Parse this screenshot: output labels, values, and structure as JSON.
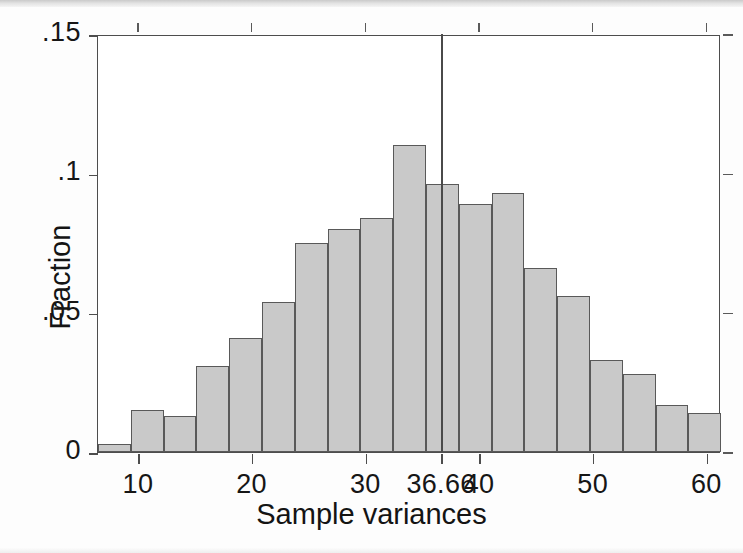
{
  "chart_data": {
    "type": "bar",
    "title": "",
    "subtitle": "",
    "xlabel": "Sample variances",
    "ylabel": "Fraction",
    "xlim": [
      6.4,
      61.2
    ],
    "ylim": [
      0,
      0.15
    ],
    "grid": false,
    "legend": null,
    "x_tick_labels": [
      "10",
      "20",
      "30",
      "36.66",
      "40",
      "50",
      "60"
    ],
    "x_tick_values": [
      10,
      20,
      30,
      36.66,
      40,
      50,
      60
    ],
    "y_tick_labels": [
      "0",
      ".05",
      ".1",
      ".15"
    ],
    "y_tick_values": [
      0,
      0.05,
      0.1,
      0.15
    ],
    "bin_width": 2.885,
    "bin_left_edges": [
      6.4,
      9.28,
      12.17,
      15.05,
      17.94,
      20.82,
      23.71,
      26.59,
      29.48,
      32.36,
      35.25,
      38.13,
      41.02,
      43.9,
      46.79,
      49.67,
      52.56,
      55.44,
      58.33
    ],
    "bin_centers": [
      7.84,
      10.72,
      13.61,
      16.49,
      19.38,
      22.26,
      25.15,
      28.03,
      30.92,
      33.8,
      36.69,
      39.57,
      42.46,
      45.34,
      48.23,
      51.11,
      54.0,
      56.88,
      59.77
    ],
    "values": [
      0.003,
      0.015,
      0.013,
      0.031,
      0.041,
      0.054,
      0.075,
      0.08,
      0.084,
      0.11,
      0.096,
      0.089,
      0.093,
      0.066,
      0.056,
      0.033,
      0.028,
      0.017,
      0.014,
      0.01
    ],
    "bars": [
      {
        "left": 6.4,
        "right": 9.28,
        "value": 0.003
      },
      {
        "left": 9.28,
        "right": 12.17,
        "value": 0.015
      },
      {
        "left": 12.17,
        "right": 15.05,
        "value": 0.013
      },
      {
        "left": 15.05,
        "right": 17.94,
        "value": 0.031
      },
      {
        "left": 17.94,
        "right": 20.82,
        "value": 0.041
      },
      {
        "left": 20.82,
        "right": 23.71,
        "value": 0.054
      },
      {
        "left": 23.71,
        "right": 26.59,
        "value": 0.075
      },
      {
        "left": 26.59,
        "right": 29.48,
        "value": 0.08
      },
      {
        "left": 29.48,
        "right": 32.36,
        "value": 0.084
      },
      {
        "left": 32.36,
        "right": 35.25,
        "value": 0.11
      },
      {
        "left": 35.25,
        "right": 38.13,
        "value": 0.096
      },
      {
        "left": 38.13,
        "right": 41.02,
        "value": 0.089
      },
      {
        "left": 41.02,
        "right": 43.9,
        "value": 0.093
      },
      {
        "left": 43.9,
        "right": 46.79,
        "value": 0.066
      },
      {
        "left": 46.79,
        "right": 49.67,
        "value": 0.056
      },
      {
        "left": 49.67,
        "right": 52.56,
        "value": 0.033
      },
      {
        "left": 52.56,
        "right": 55.44,
        "value": 0.028
      },
      {
        "left": 55.44,
        "right": 58.33,
        "value": 0.017
      },
      {
        "left": 58.33,
        "right": 61.21,
        "value": 0.014
      },
      {
        "left": 61.21,
        "right": 63.0,
        "value": 0.01
      }
    ],
    "reference_line": {
      "x": 36.66,
      "y_top": 0.15,
      "label": "36.66",
      "color": "#4a4a4a"
    },
    "colors": {
      "bar_fill": "#c9c9c9",
      "bar_edge": "#595959",
      "axis": "#4d4d4d",
      "text": "#161616"
    }
  }
}
